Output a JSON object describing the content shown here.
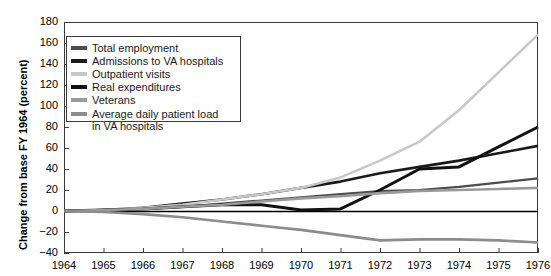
{
  "chart_data": {
    "type": "line",
    "title": "",
    "xlabel": "",
    "ylabel": "Change from base FY 1964 (percent)",
    "xlim": [
      1964,
      1976
    ],
    "ylim": [
      -40,
      180
    ],
    "grid": false,
    "legend_position": "upper-left-inside",
    "x": [
      1964,
      1965,
      1966,
      1967,
      1968,
      1969,
      1970,
      1971,
      1972,
      1973,
      1974,
      1975,
      1976
    ],
    "y_ticks": [
      -40,
      -20,
      0,
      20,
      40,
      60,
      80,
      100,
      120,
      140,
      160,
      180
    ],
    "x_ticks": [
      "1964",
      "1965",
      "1966",
      "1967",
      "1968",
      "1969",
      "1970",
      "1971",
      "1972",
      "1973",
      "1974",
      "1975",
      "1976"
    ],
    "series": [
      {
        "name": "Total employment",
        "color": "#4d4d4d",
        "width": 2.2,
        "values": [
          0,
          1,
          2,
          4,
          7,
          10,
          13,
          16,
          19,
          20,
          23,
          27,
          31
        ]
      },
      {
        "name": "Admissions to VA hospitals",
        "color": "#1a1a1a",
        "width": 2.6,
        "values": [
          0,
          1,
          3,
          7,
          11,
          16,
          22,
          28,
          36,
          42,
          48,
          55,
          62
        ]
      },
      {
        "name": "Outpatient visits",
        "color": "#c8c8c8",
        "width": 2.6,
        "values": [
          0,
          1,
          3,
          6,
          11,
          16,
          22,
          32,
          48,
          66,
          96,
          132,
          168
        ]
      },
      {
        "name": "Real expenditures",
        "color": "#111111",
        "width": 3.0,
        "values": [
          0,
          1,
          2,
          4,
          6,
          6,
          1,
          2,
          20,
          40,
          42,
          61,
          80
        ]
      },
      {
        "name": "Veterans",
        "color": "#9a9a9a",
        "width": 2.6,
        "values": [
          0,
          1,
          2,
          4,
          6,
          9,
          12,
          14,
          17,
          19,
          20,
          21,
          22
        ]
      },
      {
        "name": "Average daily patient load in VA hospitals",
        "color": "#8c8c8c",
        "width": 2.6,
        "values": [
          0,
          -1,
          -3,
          -6,
          -10,
          -14,
          -18,
          -23,
          -28,
          -27,
          -27,
          -28,
          -30
        ]
      }
    ]
  },
  "legend": {
    "entries": [
      {
        "label": "Total employment",
        "color": "#4d4d4d"
      },
      {
        "label": "Admissions to VA hospitals",
        "color": "#1a1a1a"
      },
      {
        "label": "Outpatient visits",
        "color": "#c8c8c8"
      },
      {
        "label": "Real expenditures",
        "color": "#111111"
      },
      {
        "label": "Veterans",
        "color": "#9a9a9a"
      },
      {
        "label": "Average daily patient load",
        "color": "#8c8c8c"
      }
    ],
    "continuation_line": "in VA hospitals"
  },
  "axis": {
    "zero_line_color": "#000000",
    "frame_color": "#3a3a3a"
  }
}
